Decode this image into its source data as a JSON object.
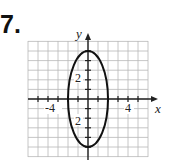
{
  "problem_number": "7.",
  "chart_data": {
    "type": "line",
    "title": "",
    "xlabel": "x",
    "ylabel": "y",
    "xlim": [
      -6,
      6
    ],
    "ylim": [
      -6,
      6
    ],
    "grid": true,
    "x_tick_labels": [
      "-4",
      "4"
    ],
    "y_tick_labels": [
      "2",
      "2"
    ],
    "curve": {
      "shape": "ellipse",
      "center": [
        0,
        0
      ],
      "semi_axis_x": 2,
      "semi_axis_y": 5,
      "equation": "x^2/4 + y^2/25 = 1"
    }
  }
}
